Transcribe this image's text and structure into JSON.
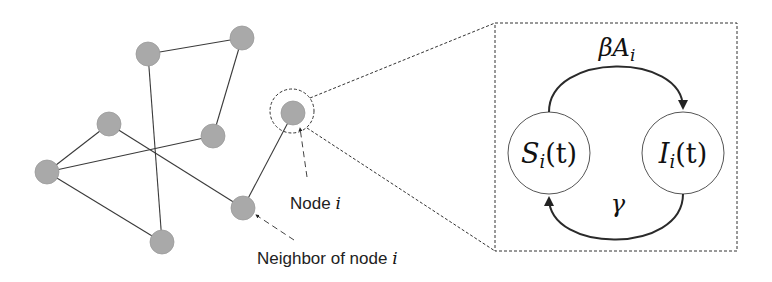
{
  "diagram": {
    "type": "network-with-SIS-inset",
    "network": {
      "nodes": [
        {
          "id": "A",
          "x": 148,
          "y": 54
        },
        {
          "id": "B",
          "x": 242,
          "y": 38
        },
        {
          "id": "C",
          "x": 109,
          "y": 124
        },
        {
          "id": "D",
          "x": 213,
          "y": 136
        },
        {
          "id": "E",
          "x": 47,
          "y": 172
        },
        {
          "id": "F",
          "x": 243,
          "y": 208
        },
        {
          "id": "G",
          "x": 162,
          "y": 242
        },
        {
          "id": "i",
          "x": 293,
          "y": 113
        }
      ],
      "edges": [
        [
          "A",
          "B"
        ],
        [
          "A",
          "G"
        ],
        [
          "B",
          "D"
        ],
        [
          "C",
          "E"
        ],
        [
          "C",
          "F"
        ],
        [
          "E",
          "D"
        ],
        [
          "E",
          "G"
        ],
        [
          "F",
          "i"
        ]
      ],
      "node_color": "#a9a9a9",
      "node_radius": 12
    },
    "annotations": {
      "node_label_prefix": "Node ",
      "node_label_var": "i",
      "neighbor_label_prefix": "Neighbor of node ",
      "neighbor_label_var": "i"
    },
    "inset": {
      "states": {
        "susceptible": {
          "symbol": "S",
          "sub": "i",
          "arg": "(t)"
        },
        "infected": {
          "symbol": "I",
          "sub": "i",
          "arg": "(t)"
        }
      },
      "transitions": {
        "infection": {
          "symbol": "βA",
          "sub": "i"
        },
        "recovery": {
          "symbol": "γ"
        }
      }
    }
  }
}
